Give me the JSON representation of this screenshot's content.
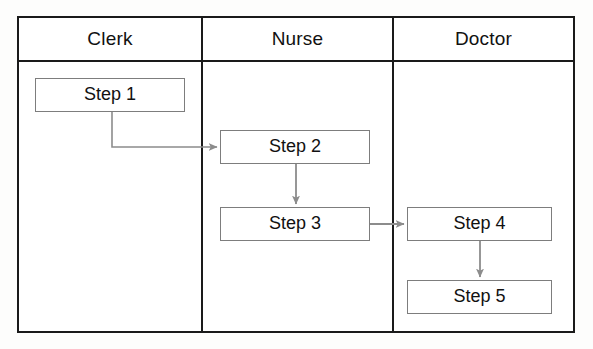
{
  "diagram": {
    "type": "swimlane-flowchart",
    "orientation": "horizontal-lanes",
    "background_color": "#fdfdfc",
    "frame_color": "#1a1a1a",
    "box_border_color": "#7d7d7d",
    "connector_color": "#8c8c8c",
    "text_color": "#111111",
    "lanes": [
      {
        "id": "lane-clerk",
        "title": "Clerk"
      },
      {
        "id": "lane-nurse",
        "title": "Nurse"
      },
      {
        "id": "lane-doctor",
        "title": "Doctor"
      }
    ],
    "nodes": [
      {
        "id": "step1",
        "label": "Step 1",
        "lane": "Clerk",
        "x": 35,
        "y": 78,
        "w": 150,
        "h": 34
      },
      {
        "id": "step2",
        "label": "Step 2",
        "lane": "Nurse",
        "x": 220,
        "y": 130,
        "w": 150,
        "h": 34
      },
      {
        "id": "step3",
        "label": "Step 3",
        "lane": "Nurse",
        "x": 220,
        "y": 207,
        "w": 150,
        "h": 34
      },
      {
        "id": "step4",
        "label": "Step 4",
        "lane": "Doctor",
        "x": 407,
        "y": 207,
        "w": 145,
        "h": 34
      },
      {
        "id": "step5",
        "label": "Step 5",
        "lane": "Doctor",
        "x": 407,
        "y": 280,
        "w": 145,
        "h": 34
      }
    ],
    "edges": [
      {
        "id": "edge-1-2",
        "from": "step1",
        "to": "step2",
        "label": "",
        "shape": "elbow-down-right"
      },
      {
        "id": "edge-2-3",
        "from": "step2",
        "to": "step3",
        "label": "",
        "shape": "straight-down"
      },
      {
        "id": "edge-3-4",
        "from": "step3",
        "to": "step4",
        "label": "",
        "shape": "straight-right"
      },
      {
        "id": "edge-4-5",
        "from": "step4",
        "to": "step5",
        "label": "",
        "shape": "straight-down"
      }
    ]
  }
}
